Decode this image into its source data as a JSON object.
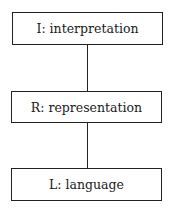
{
  "diagram": {
    "type": "vertical-layer-stack",
    "nodes": [
      {
        "id": "I",
        "label": "I: interpretation"
      },
      {
        "id": "R",
        "label": "R: representation"
      },
      {
        "id": "L",
        "label": "L: language"
      }
    ],
    "edges": [
      {
        "from": "I",
        "to": "R"
      },
      {
        "from": "R",
        "to": "L"
      }
    ]
  },
  "colors": {
    "stroke": "#222222",
    "background": "#ffffff"
  }
}
